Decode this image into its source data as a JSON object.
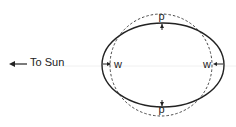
{
  "diagram": {
    "direction_label": "To Sun",
    "arrow_icon": "arrow-left-icon",
    "labels": {
      "left": "w",
      "right": "w",
      "top": "p",
      "bottom": "p"
    },
    "shapes": {
      "ellipse": {
        "cx": 163,
        "cy": 65,
        "rx": 61,
        "ry": 42,
        "style": "solid"
      },
      "circle": {
        "cx": 161,
        "cy": 65,
        "r": 51,
        "style": "dashed"
      },
      "axis_line": {
        "y": 66,
        "style": "faint"
      }
    },
    "colors": {
      "stroke": "#222222",
      "axis": "#e6e6e6"
    }
  }
}
